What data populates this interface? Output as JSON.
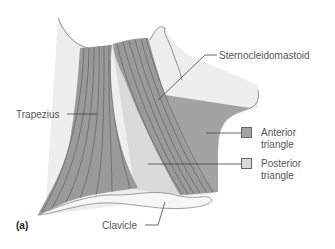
{
  "figure": {
    "panel_label": "(a)",
    "colors": {
      "muscle": "#9a9a9a",
      "muscle_fiber": "#555555",
      "anterior_triangle": "#a3a3a3",
      "posterior_triangle": "#dadada",
      "skin": "#eeeeee",
      "clavicle": "#f6f6f6",
      "outline": "#666666"
    }
  },
  "labels": {
    "sternocleidomastoid": "Sternocleidomastoid",
    "trapezius": "Trapezius",
    "clavicle": "Clavicle"
  },
  "legend": {
    "items": [
      {
        "label_line1": "Anterior",
        "label_line2": "triangle",
        "color": "#a3a3a3"
      },
      {
        "label_line1": "Posterior",
        "label_line2": "triangle",
        "color": "#dadada"
      }
    ]
  }
}
